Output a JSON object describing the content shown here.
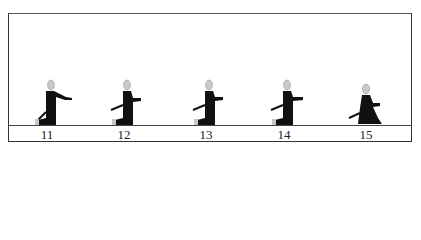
{
  "diagram": {
    "title": "",
    "frames": [
      {
        "label": "11",
        "pose": "arm-extended-forward"
      },
      {
        "label": "12",
        "pose": "hands-at-chest"
      },
      {
        "label": "13",
        "pose": "hands-at-chest"
      },
      {
        "label": "14",
        "pose": "hands-at-chest"
      },
      {
        "label": "15",
        "pose": "seated-hands-in-lap"
      }
    ],
    "colors": {
      "figure": "#111111",
      "head": "#c8c8c8",
      "frame": "#333333"
    }
  }
}
